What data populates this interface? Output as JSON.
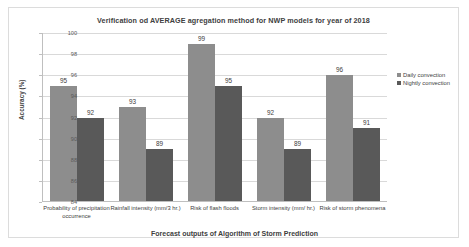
{
  "chart_data": {
    "type": "bar",
    "title": "Verification od AVERAGE agregation method for NWP models for year of 2018",
    "xlabel": "Forecast outputs of Algorithm of Storm Prediction",
    "ylabel": "Accuracy (%)",
    "ylim": [
      84,
      100
    ],
    "ytick_labels": [
      "100",
      "98",
      "96",
      "94",
      "92",
      "90",
      "88",
      "86",
      "84"
    ],
    "yticks": [
      100,
      98,
      96,
      94,
      92,
      90,
      88,
      86,
      84
    ],
    "grid": true,
    "legend_position": "right",
    "categories": [
      "Probability of precipitation occurrence",
      "Rainfall intensity (mm/3 hr.)",
      "Risk of flash floods",
      "Storm intensity (mm/ hr.)",
      "Risk of storm phenomena"
    ],
    "series": [
      {
        "name": "Daily convection",
        "color": "#8d8d8d",
        "values": [
          95,
          93,
          99,
          92,
          96
        ]
      },
      {
        "name": "Nightly convection",
        "color": "#595959",
        "values": [
          92,
          89,
          95,
          89,
          91
        ]
      }
    ]
  }
}
